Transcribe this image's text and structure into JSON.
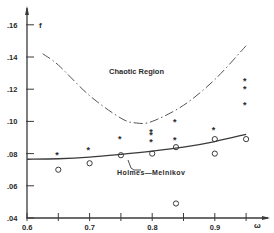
{
  "chart_data": {
    "type": "scatter",
    "title": "",
    "xlabel": "ω",
    "ylabel": "f",
    "xlim": [
      0.6,
      0.97
    ],
    "ylim": [
      0.04,
      0.17
    ],
    "x_ticks": [
      0.6,
      0.65,
      0.7,
      0.75,
      0.8,
      0.85,
      0.9,
      0.95
    ],
    "x_tick_labels": [
      "0.6",
      "",
      "0.7",
      "",
      "0.8",
      "",
      "0.9",
      ""
    ],
    "y_ticks": [
      0.04,
      0.06,
      0.08,
      0.1,
      0.12,
      0.14,
      0.16
    ],
    "y_tick_labels": [
      ".04",
      ".06",
      ".08",
      ".10",
      ".12",
      ".14",
      ".16"
    ],
    "grid": false,
    "annotations": [
      {
        "text": "Chaotic Region",
        "x": 0.78,
        "y": 0.126
      },
      {
        "text": "Holmes—Melnikov",
        "x": 0.785,
        "y": 0.072
      }
    ],
    "series": [
      {
        "name": "Holmes-Melnikov",
        "style": "solid line",
        "x": [
          0.6,
          0.65,
          0.7,
          0.75,
          0.8,
          0.85,
          0.9,
          0.95
        ],
        "y": [
          0.0765,
          0.0768,
          0.0778,
          0.0795,
          0.0815,
          0.084,
          0.0875,
          0.092
        ]
      },
      {
        "name": "Chaotic boundary",
        "style": "dash-dot line",
        "x": [
          0.625,
          0.65,
          0.7,
          0.75,
          0.775,
          0.8,
          0.85,
          0.9,
          0.95
        ],
        "y": [
          0.142,
          0.135,
          0.116,
          0.102,
          0.099,
          0.1,
          0.11,
          0.126,
          0.147
        ]
      },
      {
        "name": "chaos observed (*)",
        "marker": "star",
        "x": [
          0.65,
          0.7,
          0.75,
          0.8,
          0.8,
          0.8,
          0.838,
          0.838,
          0.9,
          0.95,
          0.95,
          0.95
        ],
        "y": [
          0.08,
          0.083,
          0.09,
          0.088,
          0.092,
          0.094,
          0.1,
          0.089,
          0.095,
          0.126,
          0.121,
          0.111
        ]
      },
      {
        "name": "no chaos (o)",
        "marker": "circle",
        "x": [
          0.65,
          0.7,
          0.75,
          0.8,
          0.838,
          0.838,
          0.9,
          0.9,
          0.95
        ],
        "y": [
          0.07,
          0.074,
          0.079,
          0.08,
          0.084,
          0.049,
          0.089,
          0.08,
          0.089
        ]
      }
    ]
  }
}
